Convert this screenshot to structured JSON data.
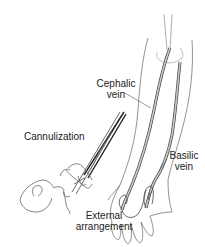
{
  "figure": {
    "type": "medical-illustration",
    "labels": {
      "cephalic": [
        "Cephalic",
        "vein"
      ],
      "basilic": [
        "Basilic",
        "vein"
      ],
      "cannulization": "Cannulization",
      "external": [
        "External",
        "arrangement"
      ]
    },
    "colors": {
      "line": "#555555",
      "vein_fill": "#bdbdbd",
      "vein_stroke": "#444444",
      "text": "#222222",
      "background": "#ffffff"
    }
  }
}
